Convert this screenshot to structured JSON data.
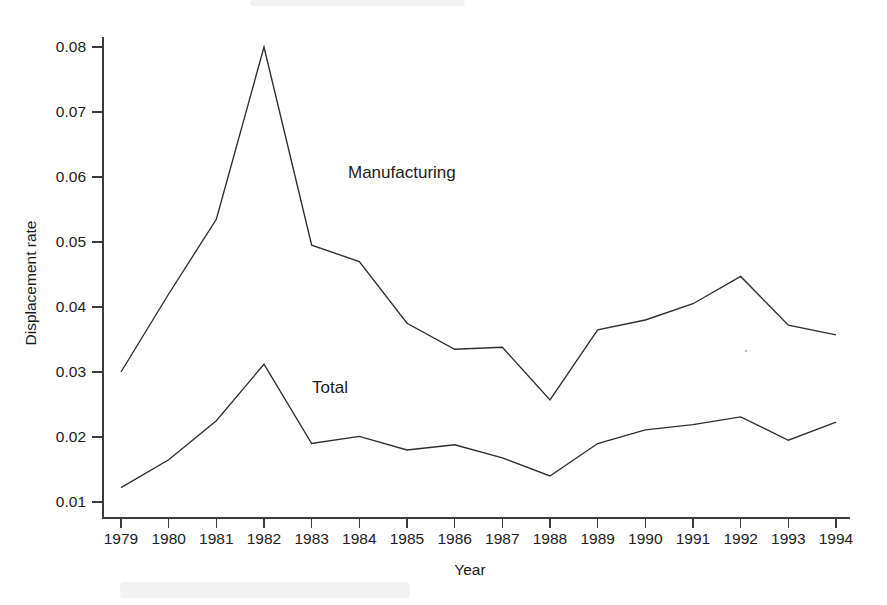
{
  "figure": {
    "background_color": "#ffffff",
    "line_color": "#2e2e2e",
    "axis_color": "#3c3c3c",
    "manufacturing_label": "Manufacturing",
    "total_label": "Total"
  },
  "chart_data": {
    "type": "line",
    "title": "",
    "xlabel": "Year",
    "ylabel": "Displacement rate",
    "x": [
      1979,
      1980,
      1981,
      1982,
      1983,
      1984,
      1985,
      1986,
      1987,
      1988,
      1989,
      1990,
      1991,
      1992,
      1993,
      1994
    ],
    "categories": [
      "1979",
      "1980",
      "1981",
      "1982",
      "1983",
      "1984",
      "1985",
      "1986",
      "1987",
      "1988",
      "1989",
      "1990",
      "1991",
      "1992",
      "1993",
      "1994"
    ],
    "xlim": [
      1979,
      1994
    ],
    "ylim": [
      0.01,
      0.08
    ],
    "ytick_labels": [
      "0.01",
      "0.02",
      "0.03",
      "0.04",
      "0.05",
      "0.06",
      "0.07",
      "0.08"
    ],
    "ytick_values": [
      0.01,
      0.02,
      0.03,
      0.04,
      0.05,
      0.06,
      0.07,
      0.08
    ],
    "grid": false,
    "legend_position": "inline-annotation",
    "series": [
      {
        "name": "Manufacturing",
        "values": [
          0.03,
          0.042,
          0.0535,
          0.08,
          0.0495,
          0.047,
          0.0375,
          0.0335,
          0.0338,
          0.0257,
          0.0365,
          0.038,
          0.0405,
          0.0447,
          0.0372,
          0.0357
        ]
      },
      {
        "name": "Total",
        "values": [
          0.0122,
          0.0165,
          0.0225,
          0.0312,
          0.019,
          0.0201,
          0.018,
          0.0188,
          0.0168,
          0.014,
          0.019,
          0.0211,
          0.0219,
          0.0231,
          0.0195,
          0.0223
        ]
      }
    ]
  }
}
